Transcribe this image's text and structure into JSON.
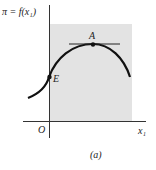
{
  "figure": {
    "y_axis_label": "π = f(x₁)",
    "x_axis_label": "x₁",
    "origin_label": "O",
    "caption": "(a)",
    "points": [
      {
        "label": "A",
        "description": "maximum point with horizontal tangent"
      },
      {
        "label": "E",
        "description": "curve intersects vertical axis"
      }
    ],
    "shaded_region": "gray rectangle for x₁ ≥ 0",
    "colors": {
      "shade": "#e3e3e3",
      "ink": "#111111"
    }
  }
}
